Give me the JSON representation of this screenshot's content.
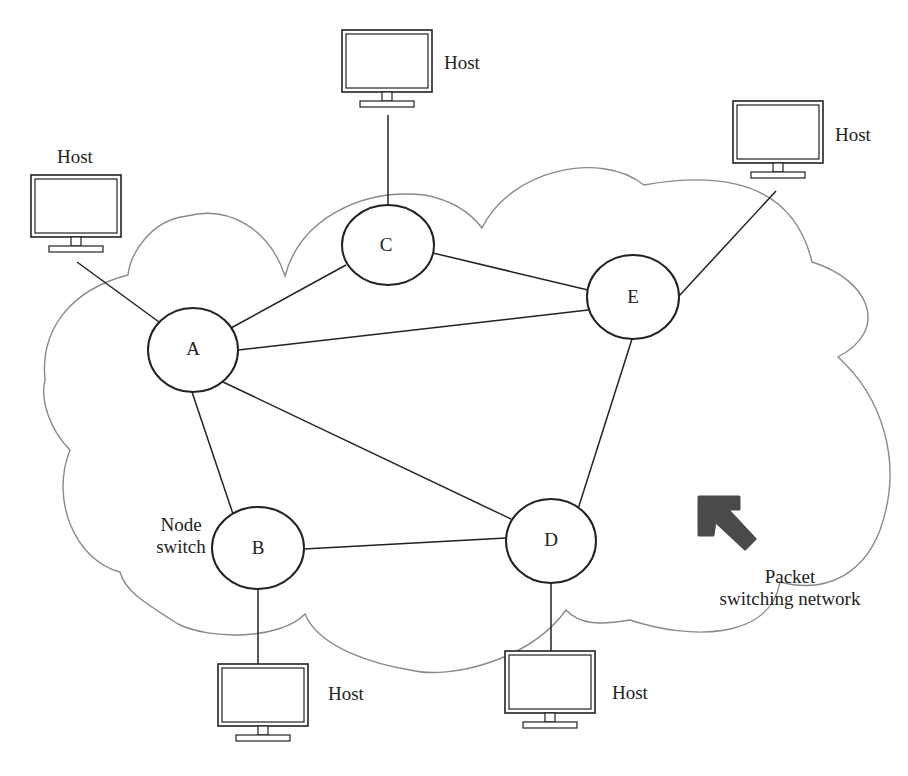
{
  "diagram": {
    "type": "packet-switching-network",
    "cloud_label": "Packet switching network",
    "cloud_label_lines": [
      "Packet",
      "switching network"
    ],
    "node_switch_label_lines": [
      "Node",
      "switch"
    ],
    "colors": {
      "line": "#222222",
      "cloud_outline": "#8a8a8a",
      "arrow": "#4a4a4a",
      "background": "#ffffff"
    },
    "nodes": [
      {
        "id": "A",
        "label": "A",
        "cx": 193,
        "cy": 350,
        "rx": 45,
        "ry": 42
      },
      {
        "id": "B",
        "label": "B",
        "cx": 258,
        "cy": 548,
        "rx": 46,
        "ry": 41
      },
      {
        "id": "C",
        "label": "C",
        "cx": 388,
        "cy": 245,
        "rx": 46,
        "ry": 40
      },
      {
        "id": "D",
        "label": "D",
        "cx": 551,
        "cy": 541,
        "rx": 45,
        "ry": 42
      },
      {
        "id": "E",
        "label": "E",
        "cx": 633,
        "cy": 297,
        "rx": 46,
        "ry": 42
      }
    ],
    "links": [
      [
        "A",
        "C"
      ],
      [
        "A",
        "E"
      ],
      [
        "A",
        "B"
      ],
      [
        "A",
        "D"
      ],
      [
        "C",
        "E"
      ],
      [
        "E",
        "D"
      ],
      [
        "B",
        "D"
      ]
    ],
    "hosts": [
      {
        "id": "host-top",
        "label": "Host",
        "attached_to": "C"
      },
      {
        "id": "host-left",
        "label": "Host",
        "attached_to": "A"
      },
      {
        "id": "host-right",
        "label": "Host",
        "attached_to": "E"
      },
      {
        "id": "host-bottom-left",
        "label": "Host",
        "attached_to": "B"
      },
      {
        "id": "host-bottom-right",
        "label": "Host",
        "attached_to": "D"
      }
    ]
  }
}
